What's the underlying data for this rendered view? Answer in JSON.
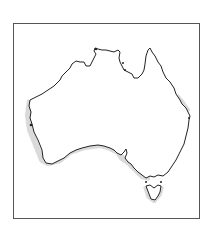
{
  "map": {
    "subject": "Australia outline map",
    "outline_color": "#222222",
    "shadow_color": "#d4d4d4",
    "frame_color": "#555555",
    "background_color": "#ffffff",
    "regions": [
      "mainland",
      "tasmania"
    ]
  }
}
